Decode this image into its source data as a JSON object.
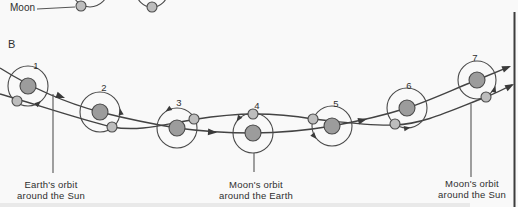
{
  "figure": {
    "panel_a": {
      "moon_label": "Moon"
    },
    "panel_b": {
      "label": "B",
      "position_numbers": [
        "1",
        "2",
        "3",
        "4",
        "5",
        "6",
        "7"
      ]
    },
    "captions": {
      "earth_orbit_sun_line1": "Earth's orbit",
      "earth_orbit_sun_line2": "around the Sun",
      "moon_orbit_earth_line1": "Moon's orbit",
      "moon_orbit_earth_line2": "around the Earth",
      "moon_orbit_sun_line1": "Moon's orbit",
      "moon_orbit_sun_line2": "around the Sun"
    },
    "colors": {
      "earth_fill": "#9c9c9c",
      "moon_fill": "#bdbdbd",
      "line": "#434343",
      "background": "#f9f9f9"
    }
  }
}
